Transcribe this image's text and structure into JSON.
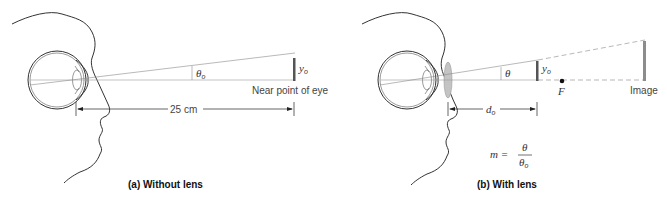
{
  "panels": [
    {
      "id": "a",
      "caption": "(a) Without lens",
      "angle_symbol": "θ",
      "angle_subscript": "o",
      "object_symbol": "y",
      "object_subscript": "o",
      "object_label": "Near point of eye",
      "distance_label": "25 cm"
    },
    {
      "id": "b",
      "caption": "(b) With lens",
      "angle_symbol": "θ",
      "object_symbol": "y",
      "object_subscript": "o",
      "focal_label": "F",
      "image_label": "Image",
      "distance_symbol": "d",
      "distance_subscript": "o",
      "equation": {
        "lhs": "m =",
        "numerator": "θ",
        "denominator": "θ",
        "denominator_subscript": "o"
      }
    }
  ],
  "colors": {
    "object_bar": "#555555",
    "image_bar": "#8c8c8c",
    "lens_fill": "#c4c4c4"
  }
}
